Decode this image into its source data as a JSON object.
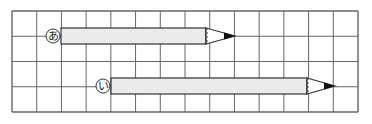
{
  "grid": {
    "cols": 14,
    "rows": 4,
    "left": 12,
    "top": 11,
    "right": 358,
    "bottom": 112,
    "line_color": "#666666"
  },
  "pencils": [
    {
      "label": "あ",
      "row": 1,
      "body_start_x": 61,
      "body_end_x": 206,
      "tip_x": 235,
      "cy": 36
    },
    {
      "label": "い",
      "row": 3,
      "body_start_x": 111,
      "body_end_x": 307,
      "tip_x": 335,
      "cy": 86
    }
  ],
  "colors": {
    "pencil_body": "#ebebeb",
    "outline": "#333333",
    "lead": "#111111"
  }
}
